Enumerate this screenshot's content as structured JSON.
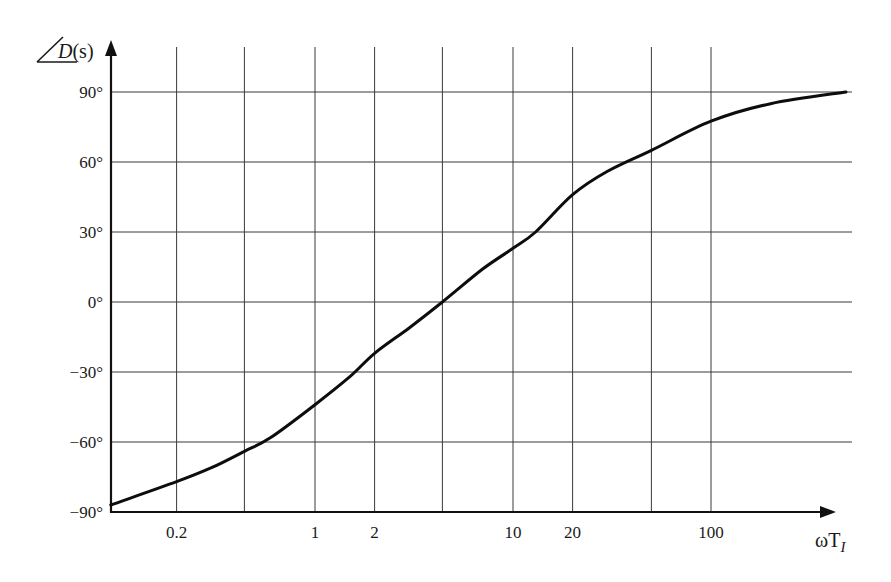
{
  "chart_data": {
    "type": "line",
    "title": "",
    "xlabel": "ωT_I",
    "xlabel_parts": {
      "main": "ωT",
      "subscript": "I"
    },
    "ylabel": "∠D(s)",
    "ylabel_parts": {
      "func": "D",
      "arg": "(s)"
    },
    "xscale": "log",
    "xlim": [
      0.093,
      480
    ],
    "ylim": [
      -90,
      90
    ],
    "grid": true,
    "legend": null,
    "x_tick_labels": [
      "0.2",
      "1",
      "2",
      "10",
      "20",
      "100"
    ],
    "x_tick_values": [
      0.2,
      1,
      2,
      10,
      20,
      100
    ],
    "x_gridlines": [
      0.2,
      0.44,
      1,
      2,
      4.4,
      10,
      20,
      50,
      100
    ],
    "y_tick_labels": [
      "90°",
      "60°",
      "30°",
      "0°",
      "−30°",
      "−60°",
      "−90°"
    ],
    "y_tick_values": [
      90,
      60,
      30,
      0,
      -30,
      -60,
      -90
    ],
    "series": [
      {
        "name": "∠D(s)",
        "color": "#0d0d0d",
        "x": [
          0.093,
          0.2,
          0.3,
          0.44,
          0.6,
          1,
          1.5,
          2,
          3,
          4.4,
          7,
          10,
          13,
          20,
          30,
          50,
          100,
          200,
          480
        ],
        "y": [
          -87,
          -77,
          -71,
          -64,
          -58,
          -44,
          -32,
          -22,
          -11,
          0,
          14,
          23,
          30,
          46,
          56,
          65,
          77.5,
          85,
          90
        ]
      }
    ]
  },
  "colors": {
    "background": "#ffffff",
    "grid": "#3a3a3a",
    "axis": "#111111",
    "curve": "#0d0d0d",
    "text": "#1a1a1a"
  }
}
